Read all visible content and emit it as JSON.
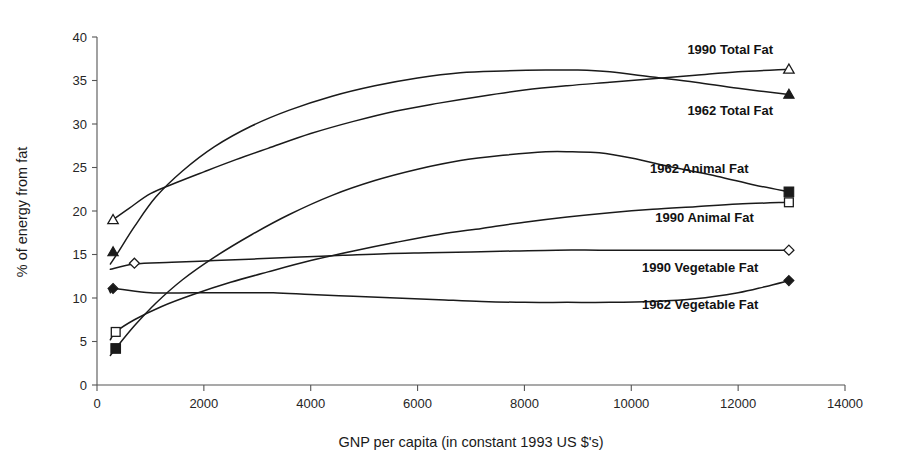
{
  "chart_data": {
    "type": "line",
    "title": "",
    "xlabel": "GNP per capita (in constant 1993 US $'s)",
    "ylabel": "% of energy from fat",
    "xlim": [
      0,
      14000
    ],
    "ylim": [
      0,
      40
    ],
    "xticks": [
      0,
      2000,
      4000,
      6000,
      8000,
      10000,
      12000,
      14000
    ],
    "xtick_labels": [
      "0",
      "2000",
      "4000",
      "6000",
      "8000",
      "10000",
      "12000",
      "14000"
    ],
    "yticks": [
      0,
      5,
      10,
      15,
      20,
      25,
      30,
      35,
      40
    ],
    "ytick_labels": [
      "0",
      "5",
      "10",
      "15",
      "20",
      "25",
      "30",
      "35",
      "40"
    ],
    "grid": false,
    "legend_position": "inline-right-of-line-ends",
    "line_color": "#1a1a1a",
    "series": [
      {
        "name": "1990 Total Fat",
        "marker": "triangle-open",
        "label_x": 11050,
        "label_y": 38.6,
        "marker_points": [
          [
            300,
            19.0
          ],
          [
            12950,
            36.3
          ]
        ],
        "x": [
          300,
          600,
          1000,
          1500,
          2000,
          2600,
          3200,
          4000,
          4800,
          5600,
          6400,
          7200,
          8000,
          8800,
          9600,
          10400,
          11200,
          12000,
          12950
        ],
        "values": [
          19.0,
          20.3,
          22.0,
          23.3,
          24.5,
          25.9,
          27.2,
          28.9,
          30.3,
          31.5,
          32.4,
          33.2,
          33.9,
          34.4,
          34.8,
          35.2,
          35.6,
          36.0,
          36.3
        ]
      },
      {
        "name": "1962 Total Fat",
        "marker": "triangle-filled",
        "label_x": 11050,
        "label_y": 31.6,
        "marker_points": [
          [
            300,
            15.3
          ],
          [
            12950,
            33.4
          ]
        ],
        "x": [
          250,
          400,
          700,
          1100,
          1600,
          2200,
          2900,
          3600,
          4400,
          5200,
          6000,
          6800,
          7600,
          8400,
          9000,
          9600,
          10400,
          11200,
          12000,
          12950
        ],
        "values": [
          13.9,
          15.3,
          18.2,
          21.6,
          24.6,
          27.4,
          29.8,
          31.6,
          33.2,
          34.4,
          35.3,
          35.9,
          36.1,
          36.2,
          36.2,
          36.0,
          35.4,
          34.8,
          34.1,
          33.4
        ]
      },
      {
        "name": "1962 Animal Fat",
        "marker": "square-filled",
        "label_x": 10350,
        "label_y": 24.9,
        "marker_points": [
          [
            350,
            4.2
          ],
          [
            12950,
            22.2
          ]
        ],
        "x": [
          250,
          350,
          700,
          1100,
          1600,
          2200,
          2900,
          3600,
          4400,
          5200,
          6000,
          6800,
          7600,
          8400,
          8900,
          9400,
          10000,
          10800,
          11600,
          12300,
          12950
        ],
        "values": [
          3.4,
          4.2,
          6.8,
          9.4,
          12.1,
          14.7,
          17.3,
          19.6,
          21.8,
          23.5,
          24.8,
          25.8,
          26.4,
          26.8,
          26.8,
          26.7,
          26.1,
          25.0,
          24.0,
          23.0,
          22.2
        ]
      },
      {
        "name": "1990 Animal Fat",
        "marker": "square-open",
        "label_x": 10450,
        "label_y": 19.3,
        "marker_points": [
          [
            350,
            6.1
          ],
          [
            12950,
            21.0
          ]
        ],
        "x": [
          250,
          350,
          700,
          1200,
          1800,
          2500,
          3200,
          4000,
          4800,
          5600,
          6400,
          7200,
          8000,
          8800,
          9600,
          10400,
          11200,
          12000,
          12950
        ],
        "values": [
          5.2,
          6.1,
          7.5,
          9.0,
          10.4,
          11.8,
          13.0,
          14.3,
          15.4,
          16.4,
          17.3,
          18.0,
          18.7,
          19.3,
          19.8,
          20.2,
          20.5,
          20.8,
          21.0
        ]
      },
      {
        "name": "1990 Vegetable Fat",
        "marker": "diamond-open",
        "label_x": 10200,
        "label_y": 13.5,
        "marker_points": [
          [
            700,
            14.0
          ],
          [
            12950,
            15.5
          ]
        ],
        "x": [
          250,
          700,
          1400,
          2200,
          3000,
          3800,
          4600,
          5400,
          6200,
          7000,
          7800,
          8600,
          9400,
          10200,
          11000,
          11800,
          12400,
          12950
        ],
        "values": [
          13.3,
          13.9,
          14.1,
          14.3,
          14.5,
          14.7,
          14.9,
          15.1,
          15.2,
          15.3,
          15.4,
          15.5,
          15.5,
          15.5,
          15.5,
          15.5,
          15.5,
          15.5
        ]
      },
      {
        "name": "1962 Vegetable Fat",
        "marker": "diamond-filled",
        "label_x": 10200,
        "label_y": 9.3,
        "marker_points": [
          [
            300,
            11.1
          ],
          [
            12950,
            12.0
          ]
        ],
        "x": [
          250,
          300,
          1000,
          1800,
          2600,
          3300,
          4000,
          4800,
          5600,
          6400,
          7200,
          8000,
          8800,
          9600,
          10400,
          11200,
          12000,
          12500,
          12950
        ],
        "values": [
          10.6,
          11.1,
          10.6,
          10.6,
          10.6,
          10.6,
          10.4,
          10.2,
          10.0,
          9.8,
          9.6,
          9.5,
          9.5,
          9.5,
          9.6,
          9.9,
          10.6,
          11.3,
          12.0
        ]
      }
    ]
  }
}
